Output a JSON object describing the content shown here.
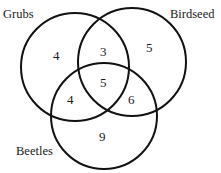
{
  "diagram": {
    "type": "venn",
    "sets": [
      {
        "name": "Grubs",
        "only": "4"
      },
      {
        "name": "Birdseed",
        "only": "5"
      },
      {
        "name": "Beetles",
        "only": "9"
      }
    ],
    "regions": {
      "grubs_only": "4",
      "birdseed_only": "5",
      "beetles_only": "9",
      "grubs_birdseed": "3",
      "grubs_beetles": "4",
      "birdseed_beetles": "6",
      "all_three": "5"
    },
    "labels": {
      "grubs": "Grubs",
      "birdseed": "Birdseed",
      "beetles": "Beetles"
    },
    "stroke_color": "#111111"
  }
}
